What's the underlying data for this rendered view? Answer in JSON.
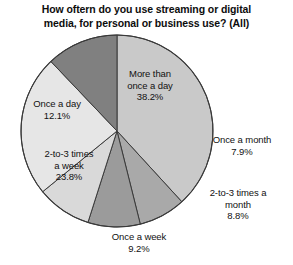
{
  "chart_data": {
    "type": "pie",
    "title": "How oftern do you use streaming or digital\nmedia, for personal or business use? (All)",
    "xlabel": "",
    "ylabel": "",
    "legend": "none",
    "grid": false,
    "units": "percent",
    "total": 100.0,
    "start_angle_deg": 0,
    "direction": "clockwise",
    "categories": [
      "More than once a day",
      "Once a month",
      "2-to-3 times a month",
      "Once a week",
      "2-to-3 times a week",
      "Once a day"
    ],
    "values": [
      38.2,
      7.9,
      8.8,
      9.2,
      23.8,
      12.1
    ],
    "slices": [
      {
        "label": "More than\nonce a day",
        "label_flat": "More than once a day",
        "value": 38.2,
        "value_text": "38.2%",
        "color": "#c9c9c9",
        "start_deg": 0.0,
        "end_deg": 137.52,
        "label_placement": "inside"
      },
      {
        "label": "Once a month",
        "label_flat": "Once a month",
        "value": 7.9,
        "value_text": "7.9%",
        "color": "#a9a9a9",
        "start_deg": 137.52,
        "end_deg": 165.96,
        "label_placement": "outside-right"
      },
      {
        "label": "2-to-3 times a\nmonth",
        "label_flat": "2-to-3 times a month",
        "value": 8.8,
        "value_text": "8.8%",
        "color": "#9b9b9b",
        "start_deg": 165.96,
        "end_deg": 197.64,
        "label_placement": "outside-right"
      },
      {
        "label": "Once a week",
        "label_flat": "Once a week",
        "value": 9.2,
        "value_text": "9.2%",
        "color": "#d9d9d9",
        "start_deg": 197.64,
        "end_deg": 230.76,
        "label_placement": "outside-bottom"
      },
      {
        "label": "2-to-3 times\na week",
        "label_flat": "2-to-3 times a week",
        "value": 23.8,
        "value_text": "23.8%",
        "color": "#e6e6e6",
        "start_deg": 230.76,
        "end_deg": 316.44,
        "label_placement": "inside"
      },
      {
        "label": "Once a day",
        "label_flat": "Once a day",
        "value": 12.1,
        "value_text": "12.1%",
        "color": "#808080",
        "start_deg": 316.44,
        "end_deg": 360.0,
        "label_placement": "inside"
      }
    ]
  },
  "labels": {
    "more_than_once_a_day": "More than\nonce a day\n38.2%",
    "once_a_day": "Once a day\n12.1%",
    "two_to_three_times_a_week": "2-to-3 times\na week\n23.8%",
    "once_a_week": "Once a week\n9.2%",
    "once_a_month": "Once a month\n7.9%",
    "two_to_three_times_a_month": "2-to-3 times a\nmonth\n8.8%"
  },
  "style": {
    "background": "#ffffff",
    "outline": "#3a3a3a",
    "text": "#111111"
  }
}
